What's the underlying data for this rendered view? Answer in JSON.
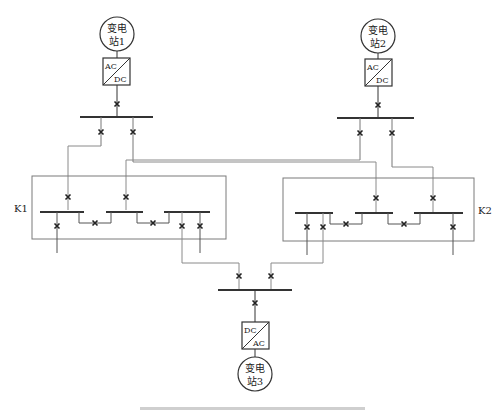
{
  "diagram": {
    "stations": [
      {
        "id": "station-1",
        "line1": "变电",
        "line2": "站1",
        "converter_top": "AC",
        "converter_bottom": "DC"
      },
      {
        "id": "station-2",
        "line1": "变电",
        "line2": "站2",
        "converter_top": "AC",
        "converter_bottom": "DC"
      },
      {
        "id": "station-3",
        "line1": "变电",
        "line2": "站3",
        "converter_top": "DC",
        "converter_bottom": "AC"
      }
    ],
    "groups": [
      {
        "id": "K1",
        "label": "K1"
      },
      {
        "id": "K2",
        "label": "K2"
      }
    ],
    "breaker_symbol": "×",
    "colors": {
      "line": "#3a3a3a",
      "thin_line": "#8a8a8a",
      "box": "#6a6a6a"
    }
  }
}
